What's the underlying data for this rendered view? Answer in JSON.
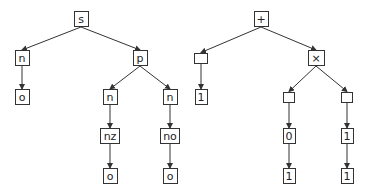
{
  "diagram": {
    "type": "two parse trees",
    "colors": {
      "stroke": "#333333",
      "background": "#ffffff",
      "text": "#222222"
    },
    "trees": [
      {
        "name": "left-tree",
        "nodes": [
          {
            "id": "s",
            "label": "s",
            "cx": 81,
            "cy": 19,
            "w": 15,
            "h": 16
          },
          {
            "id": "n1",
            "label": "n",
            "cx": 22,
            "cy": 58,
            "w": 15,
            "h": 16
          },
          {
            "id": "o1",
            "label": "o",
            "cx": 22,
            "cy": 97,
            "w": 15,
            "h": 16
          },
          {
            "id": "p",
            "label": "p",
            "cx": 140,
            "cy": 58,
            "w": 15,
            "h": 16
          },
          {
            "id": "n2",
            "label": "n",
            "cx": 110,
            "cy": 97,
            "w": 15,
            "h": 16
          },
          {
            "id": "n3",
            "label": "n",
            "cx": 170,
            "cy": 97,
            "w": 15,
            "h": 16
          },
          {
            "id": "nz",
            "label": "nz",
            "cx": 110,
            "cy": 136,
            "w": 20,
            "h": 16
          },
          {
            "id": "no",
            "label": "no",
            "cx": 170,
            "cy": 136,
            "w": 20,
            "h": 16
          },
          {
            "id": "o2",
            "label": "o",
            "cx": 110,
            "cy": 176,
            "w": 15,
            "h": 16
          },
          {
            "id": "o3",
            "label": "o",
            "cx": 170,
            "cy": 176,
            "w": 15,
            "h": 16
          }
        ],
        "edges": [
          [
            "s",
            "n1"
          ],
          [
            "s",
            "p"
          ],
          [
            "n1",
            "o1"
          ],
          [
            "p",
            "n2"
          ],
          [
            "p",
            "n3"
          ],
          [
            "n2",
            "nz"
          ],
          [
            "n3",
            "no"
          ],
          [
            "nz",
            "o2"
          ],
          [
            "no",
            "o3"
          ]
        ]
      },
      {
        "name": "right-tree",
        "nodes": [
          {
            "id": "plus",
            "label": "+",
            "cx": 261,
            "cy": 19,
            "w": 15,
            "h": 16
          },
          {
            "id": "e1",
            "label": "",
            "cx": 201,
            "cy": 58,
            "w": 14,
            "h": 11
          },
          {
            "id": "one1",
            "label": "1",
            "cx": 201,
            "cy": 97,
            "w": 13,
            "h": 16
          },
          {
            "id": "times",
            "label": "×",
            "cx": 316,
            "cy": 58,
            "w": 17,
            "h": 16
          },
          {
            "id": "e2",
            "label": "",
            "cx": 289,
            "cy": 97,
            "w": 12,
            "h": 11
          },
          {
            "id": "e3",
            "label": "",
            "cx": 347,
            "cy": 97,
            "w": 12,
            "h": 11
          },
          {
            "id": "zero",
            "label": "0",
            "cx": 289,
            "cy": 136,
            "w": 13,
            "h": 16
          },
          {
            "id": "one2",
            "label": "1",
            "cx": 347,
            "cy": 136,
            "w": 13,
            "h": 16
          },
          {
            "id": "one3",
            "label": "1",
            "cx": 289,
            "cy": 176,
            "w": 13,
            "h": 16
          },
          {
            "id": "one4",
            "label": "1",
            "cx": 347,
            "cy": 176,
            "w": 13,
            "h": 16
          }
        ],
        "edges": [
          [
            "plus",
            "e1"
          ],
          [
            "plus",
            "times"
          ],
          [
            "e1",
            "one1"
          ],
          [
            "times",
            "e2"
          ],
          [
            "times",
            "e3"
          ],
          [
            "e2",
            "zero"
          ],
          [
            "e3",
            "one2"
          ],
          [
            "zero",
            "one3"
          ],
          [
            "one2",
            "one4"
          ]
        ]
      }
    ]
  }
}
